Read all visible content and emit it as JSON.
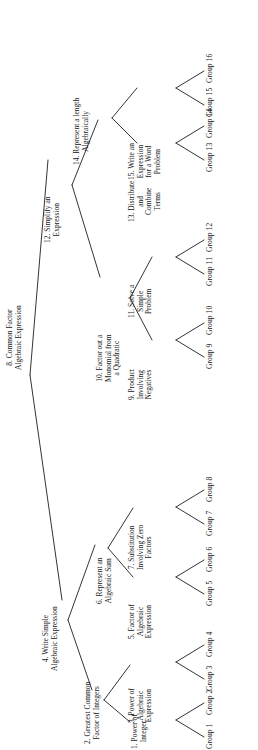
{
  "figure": {
    "type": "tree",
    "orientation": "rotated-90-ccw"
  },
  "colors": {
    "background": "#ffffff",
    "line": "#1d1d1d",
    "text": "#151515"
  },
  "nodes": {
    "n8": {
      "line1": "8. Common Factor",
      "line2": "Algebraic Expression"
    },
    "n4": {
      "line1": "4. Write Simple",
      "line2": "Algebraic Expression"
    },
    "n12": {
      "line1": "12. Simplify an",
      "line2": "Expression"
    },
    "n2": {
      "line1": "2. Greatest Common",
      "line2": "Factor of Integers"
    },
    "n6": {
      "line1": "6. Represent an",
      "line2": "Algebraic Sum"
    },
    "n10": {
      "line1": "10. Factor out a",
      "line2": "Monomial from",
      "line3": "a Quadratic"
    },
    "n14": {
      "line1": "14. Represent a length",
      "line2": "Algebraically"
    },
    "n1": {
      "line1": "1. Power of",
      "line2": "Integer"
    },
    "n3": {
      "line1": "3. Power of",
      "line2": "Algebraic",
      "line3": "Expression"
    },
    "n5": {
      "line1": "5. Factor of",
      "line2": "Algebraic",
      "line3": "Expression"
    },
    "n7": {
      "line1": "7. Substitution",
      "line2": "Involving Zero",
      "line3": "Factors"
    },
    "n9": {
      "line1": "9. Product",
      "line2": "Involving",
      "line3": "Negatives"
    },
    "n11": {
      "line1": "11. Solve a",
      "line2": "Simple",
      "line3": "Problem"
    },
    "n13": {
      "line1": "13. Distribute",
      "line2": "and",
      "line3": "Combine",
      "line4": "Terms"
    },
    "n15": {
      "line1": "15. Write an",
      "line2": "Expression",
      "line3": "for a Word",
      "line4": "Problem"
    }
  },
  "leaves": [
    {
      "id": "g1",
      "label": "Group 1"
    },
    {
      "id": "g2",
      "label": "Group 2"
    },
    {
      "id": "g3",
      "label": "Group 3"
    },
    {
      "id": "g4",
      "label": "Group 4"
    },
    {
      "id": "g5",
      "label": "Group 5"
    },
    {
      "id": "g6",
      "label": "Group 6"
    },
    {
      "id": "g7",
      "label": "Group 7"
    },
    {
      "id": "g8",
      "label": "Group 8"
    },
    {
      "id": "g9",
      "label": "Group 9"
    },
    {
      "id": "g10",
      "label": "Group 10"
    },
    {
      "id": "g11",
      "label": "Group 11"
    },
    {
      "id": "g12",
      "label": "Group 12"
    },
    {
      "id": "g13",
      "label": "Group 13"
    },
    {
      "id": "g14",
      "label": "Group 14"
    },
    {
      "id": "g15",
      "label": "Group 15"
    },
    {
      "id": "g16",
      "label": "Group 16"
    }
  ]
}
